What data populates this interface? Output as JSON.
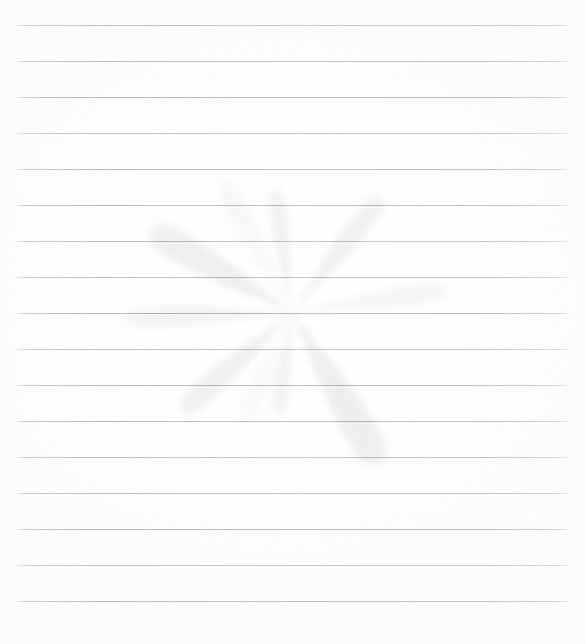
{
  "document": {
    "kind": "scanned-ruled-paper",
    "title": "Blank ruled notebook page with faint flower watermark",
    "width": 585,
    "height": 644,
    "background_color": "#fefefe",
    "has_visible_text": false,
    "text_content": ""
  },
  "paper": {
    "surface_color": "#fdfdfd",
    "grain_opacity": 0.55
  },
  "ruling": {
    "line_color": "#a8acb4",
    "line_thickness_px": 1,
    "spacing_px": 36,
    "left_inset_px": 12,
    "right_inset_px": 12,
    "count": 17,
    "y_positions": [
      25,
      61,
      97,
      133,
      169,
      205,
      241,
      277,
      313,
      349,
      385,
      421,
      457,
      493,
      529,
      565,
      601
    ]
  },
  "watermark": {
    "name": "flower-watermark",
    "shape": "radiating-petals",
    "petal_color": "#ebecee",
    "petal_opacity": 0.85,
    "center_x": 292,
    "center_y": 312,
    "petal_count": 10,
    "petals": [
      {
        "id": "petal-top",
        "angle_deg": 352,
        "length": 128,
        "width": 21,
        "tip_x": 334,
        "tip_y": 68,
        "opacity": 0.62
      },
      {
        "id": "petal-upper-left",
        "angle_deg": 300,
        "length": 168,
        "width": 36,
        "tip_x": 176,
        "tip_y": 133,
        "opacity": 0.85
      },
      {
        "id": "petal-upper-mid",
        "angle_deg": 332,
        "length": 152,
        "width": 26,
        "tip_x": 262,
        "tip_y": 134,
        "opacity": 0.42
      },
      {
        "id": "petal-upper-right",
        "angle_deg": 38,
        "length": 150,
        "width": 27,
        "tip_x": 463,
        "tip_y": 203,
        "opacity": 0.7
      },
      {
        "id": "petal-right",
        "angle_deg": 82,
        "length": 160,
        "width": 24,
        "tip_x": 524,
        "tip_y": 307,
        "opacity": 0.5
      },
      {
        "id": "petal-left",
        "angle_deg": 268,
        "length": 172,
        "width": 25,
        "tip_x": 52,
        "tip_y": 305,
        "opacity": 0.55
      },
      {
        "id": "petal-lower-left",
        "angle_deg": 228,
        "length": 152,
        "width": 29,
        "tip_x": 96,
        "tip_y": 438,
        "opacity": 0.72
      },
      {
        "id": "petal-lower-mid",
        "angle_deg": 204,
        "length": 120,
        "width": 22,
        "tip_x": 196,
        "tip_y": 460,
        "opacity": 0.36
      },
      {
        "id": "petal-lower-right",
        "angle_deg": 150,
        "length": 180,
        "width": 40,
        "tip_x": 398,
        "tip_y": 520,
        "opacity": 0.88
      },
      {
        "id": "petal-bottom",
        "angle_deg": 188,
        "length": 108,
        "width": 20,
        "tip_x": 228,
        "tip_y": 568,
        "opacity": 0.58
      }
    ]
  }
}
